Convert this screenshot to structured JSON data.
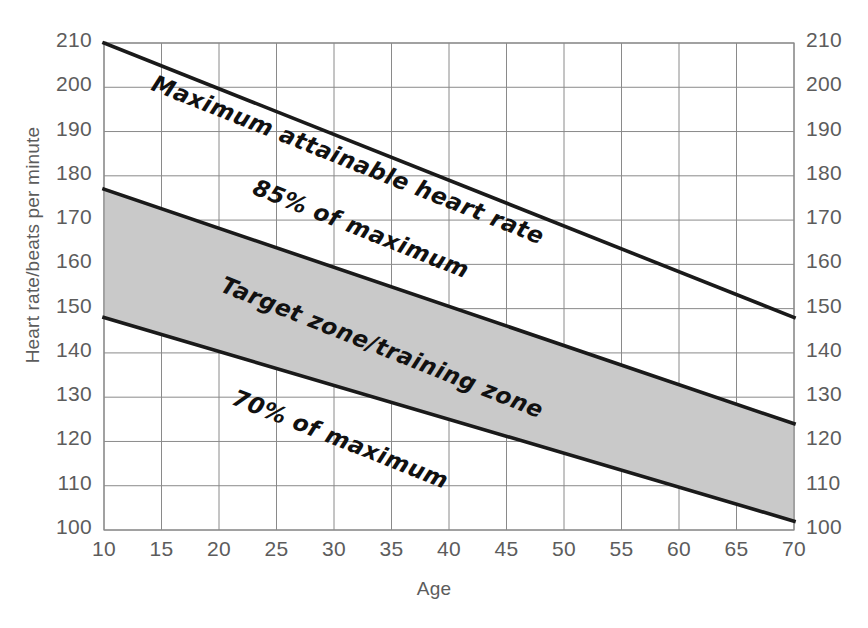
{
  "chart_data": {
    "type": "line",
    "title": "",
    "xlabel": "Age",
    "ylabel": "Heart rate/beats per minute",
    "xlim": [
      10,
      70
    ],
    "ylim": [
      100,
      210
    ],
    "xticks": [
      10,
      15,
      20,
      25,
      30,
      35,
      40,
      45,
      50,
      55,
      60,
      65,
      70
    ],
    "yticks": [
      100,
      110,
      120,
      130,
      140,
      150,
      160,
      170,
      180,
      190,
      200,
      210
    ],
    "grid": true,
    "legend_position": "inline-along-lines",
    "x": [
      10,
      70
    ],
    "series": [
      {
        "name": "Maximum attainable heart rate",
        "values": [
          210,
          148
        ],
        "label": "Maximum attainable heart rate"
      },
      {
        "name": "85% of maximum",
        "values": [
          177,
          124
        ],
        "label": "85% of maximum"
      },
      {
        "name": "70% of maximum",
        "values": [
          148,
          102
        ],
        "label": "70% of maximum"
      }
    ],
    "shaded_region": {
      "label": "Target zone/training zone",
      "upper_series": "85% of maximum",
      "lower_series": "70% of maximum",
      "color": "#c9c9c9"
    },
    "annotations": [
      "Maximum attainable heart rate",
      "85% of maximum",
      "Target zone/training zone",
      "70% of maximum"
    ],
    "colors": {
      "line": "#1a1a1a",
      "grid": "#8a8a8a",
      "zone": "#c9c9c9",
      "text": "#5c5c5c"
    }
  },
  "axes": {
    "y_left_labels": [
      "210",
      "200",
      "190",
      "180",
      "170",
      "160",
      "150",
      "140",
      "130",
      "120",
      "110",
      "100"
    ],
    "y_right_labels": [
      "210",
      "200",
      "190",
      "180",
      "170",
      "160",
      "150",
      "140",
      "130",
      "120",
      "110",
      "100"
    ],
    "x_labels": [
      "10",
      "15",
      "20",
      "25",
      "30",
      "35",
      "40",
      "45",
      "50",
      "55",
      "60",
      "65",
      "70"
    ]
  },
  "labels": {
    "y_title": "Heart rate/beats per minute",
    "x_title": "Age",
    "max_line": "Maximum attainable heart rate",
    "upper_pct": "85% of maximum",
    "zone": "Target zone/training zone",
    "lower_pct": "70% of maximum"
  }
}
